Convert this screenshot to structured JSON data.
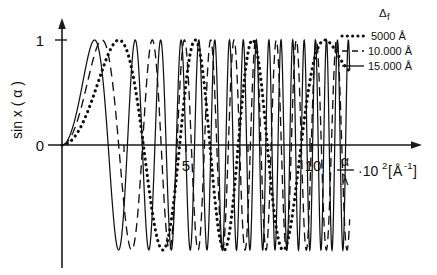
{
  "figure": {
    "name": "contrast-transfer-function-plot",
    "background": "#ffffff",
    "ink": "#111111"
  },
  "axes": {
    "y_axis_label": "sin x ( α )",
    "y_ticks": [
      {
        "value": 1,
        "label": "1"
      },
      {
        "value": 0,
        "label": "0"
      }
    ],
    "x_ticks": [
      {
        "value": 2.5,
        "label": ""
      },
      {
        "value": 5,
        "label": "5"
      },
      {
        "value": 7.5,
        "label": ""
      },
      {
        "value": 10,
        "label": "10"
      }
    ],
    "x_axis_label": {
      "numerator": "α",
      "denominator": "λ",
      "multiplier": "·10",
      "exponent": "2",
      "unit_open": "[",
      "unit": "Å",
      "unit_exponent": "-1",
      "unit_close": "]"
    }
  },
  "legend": {
    "title_symbol": "Δ",
    "title_sub": "f",
    "entries": [
      {
        "label": "5000 Å",
        "style": "dotted",
        "defocus_angstrom": 5000
      },
      {
        "label": "10.000 Å",
        "style": "dashed",
        "defocus_angstrom": 10000
      },
      {
        "label": "15.000 Å",
        "style": "solid",
        "defocus_angstrom": 15000
      }
    ]
  },
  "chart_data": {
    "type": "line",
    "title": "",
    "subtitle": "",
    "xlabel": "α/λ · 10^2 [Å^-1]",
    "ylabel": "sin x ( α )",
    "xlim": [
      0,
      11.6
    ],
    "ylim": [
      -1.12,
      1.12
    ],
    "xticks": [
      2.5,
      5,
      7.5,
      10
    ],
    "xticklabels": [
      "",
      "5",
      "",
      "10"
    ],
    "yticks": [
      0,
      1
    ],
    "yticklabels": [
      "0",
      "1"
    ],
    "grid": false,
    "legend_position": "top-right",
    "legend_title": "Δf",
    "model": {
      "formula": "sin( pi*defocus*lambda*u^2 - 0.5*pi*Cs*lambda^3*u^4 )",
      "note": "Contrast transfer function; u in units of 10^-2 A^-1",
      "a_coefficients_per_series": [
        0.0966,
        0.1932,
        0.2898
      ],
      "b_coefficient": 0.000345
    },
    "series": [
      {
        "name": "5000 Å",
        "style": "dotted",
        "color": "#111111",
        "x": [
          0,
          0.4,
          0.8,
          1.2,
          1.6,
          2.0,
          2.4,
          2.8,
          3.2,
          3.6,
          4.0,
          4.4,
          4.8,
          5.2,
          5.6,
          6.0,
          6.4,
          6.8,
          7.2,
          7.6,
          8.0,
          8.4,
          8.8,
          9.2,
          9.6,
          10.0,
          10.4,
          10.8,
          11.2
        ],
        "y": [
          0.0,
          0.015,
          0.062,
          0.138,
          0.24,
          0.36,
          0.49,
          0.62,
          0.75,
          0.86,
          0.94,
          0.99,
          1.0,
          0.96,
          0.87,
          0.72,
          0.51,
          0.26,
          -0.02,
          -0.31,
          -0.58,
          -0.79,
          -0.94,
          -1.0,
          -0.97,
          -0.85,
          -0.64,
          -0.34,
          0.02
        ]
      },
      {
        "name": "10.000 Å",
        "style": "dashed",
        "color": "#111111",
        "x": [
          0,
          0.4,
          0.8,
          1.2,
          1.6,
          2.0,
          2.4,
          2.8,
          3.2,
          3.6,
          4.0,
          4.4,
          4.8,
          5.2,
          5.6,
          6.0,
          6.4,
          6.8,
          7.2,
          7.6,
          8.0,
          8.4,
          8.8,
          9.2,
          9.6,
          10.0,
          10.4,
          10.8,
          11.2
        ],
        "y": [
          0.0,
          0.031,
          0.123,
          0.27,
          0.46,
          0.66,
          0.83,
          0.95,
          1.0,
          0.96,
          0.84,
          0.62,
          0.33,
          -0.01,
          -0.36,
          -0.67,
          -0.89,
          -1.0,
          -0.95,
          -0.77,
          -0.47,
          -0.09,
          0.31,
          0.67,
          0.92,
          1.0,
          0.88,
          0.57,
          0.12
        ]
      },
      {
        "name": "15.000 Å",
        "style": "solid",
        "color": "#111111",
        "x": [
          0,
          0.4,
          0.8,
          1.2,
          1.6,
          2.0,
          2.4,
          2.8,
          3.2,
          3.6,
          4.0,
          4.4,
          4.8,
          5.2,
          5.6,
          6.0,
          6.4,
          6.8,
          7.2,
          7.6,
          8.0,
          8.4,
          8.8,
          9.2,
          9.6,
          10.0,
          10.4,
          10.8,
          11.2
        ],
        "y": [
          0.0,
          0.046,
          0.183,
          0.395,
          0.64,
          0.86,
          0.98,
          0.99,
          0.86,
          0.6,
          0.23,
          -0.19,
          -0.58,
          -0.87,
          -1.0,
          -0.93,
          -0.68,
          -0.28,
          0.18,
          0.61,
          0.9,
          1.0,
          0.85,
          0.49,
          -0.01,
          -0.51,
          -0.88,
          -1.0,
          -0.81
        ]
      }
    ]
  }
}
